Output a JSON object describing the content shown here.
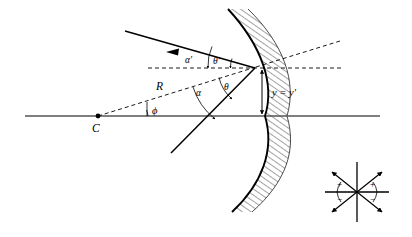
{
  "figure": {
    "type": "optics-ray-diagram",
    "background_color": "#ffffff",
    "ink_color": "#000000",
    "axis_color": "#555555"
  },
  "labels": {
    "center_of_curvature": "C",
    "radius": "R",
    "phi": "ϕ",
    "alpha": "α",
    "alpha_prime": "α′",
    "theta": "θ",
    "theta_prime": "θ′",
    "height_equality": "y = y′"
  },
  "inset": {
    "name": "sign-convention-key",
    "plus_left": "+",
    "plus_right": "+",
    "minus_left": "−",
    "minus_right": "−"
  },
  "elements": {
    "optical_axis": "optical-axis",
    "mirror_surface": "mirror-surface-arc",
    "mirror_hatching": "mirror-hatching",
    "incident_ray": "incident-ray",
    "reflected_ray": "reflected-ray",
    "normal_line": "normal-dashed-line",
    "radius_line": "radius-dashed-line",
    "horizontal_reference": "horizontal-dashed-reference",
    "height_marker": "height-double-arrow"
  },
  "geometry": {
    "axis_y": 116,
    "axis_x_start": 25,
    "axis_x_end": 380,
    "center_point": [
      98,
      116
    ],
    "incidence_point": [
      255,
      68
    ],
    "mirror_vertex": [
      265,
      116
    ],
    "mirror_arc_top": [
      228,
      9
    ],
    "mirror_arc_bottom": [
      232,
      212
    ]
  }
}
